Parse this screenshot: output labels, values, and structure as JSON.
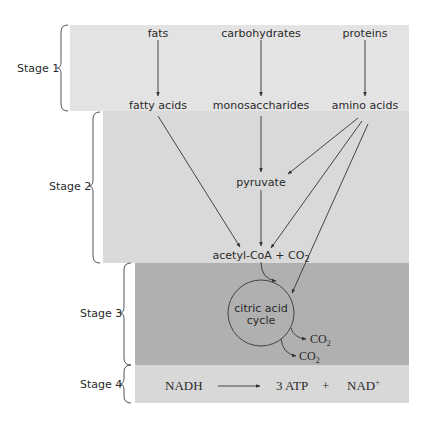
{
  "stages": [
    {
      "label": "Stage 1",
      "color": "#e3e3e3"
    },
    {
      "label": "Stage 2",
      "color": "#d9d9d9"
    },
    {
      "label": "Stage 3",
      "color": "#b0b0b0"
    },
    {
      "label": "Stage 4",
      "color": "#d8d8d8"
    }
  ],
  "stage1": {
    "inputs": [
      "fats",
      "carbohydrates",
      "proteins"
    ],
    "outputs": [
      "fatty acids",
      "monosaccharides",
      "amino acids"
    ]
  },
  "stage2": {
    "intermediate": "pyruvate",
    "product_main": "acetyl-CoA + CO",
    "product_sub": "2"
  },
  "stage3": {
    "cycle_line1": "citric acid",
    "cycle_line2": "cycle",
    "byproduct_main": "CO",
    "byproduct_sub": "2"
  },
  "stage4": {
    "reactant": "NADH",
    "product": "3 ATP",
    "plus": "+",
    "product2_main": "NAD",
    "product2_sup": "+"
  }
}
